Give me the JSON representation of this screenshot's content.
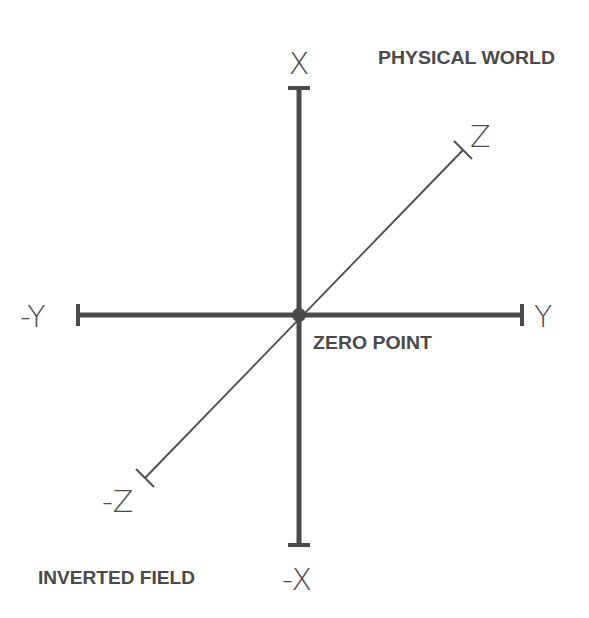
{
  "diagram": {
    "type": "coordinate-axes",
    "colors": {
      "stroke": "#4a4a4a",
      "background": "#ffffff"
    },
    "origin": {
      "label": "ZERO POINT"
    },
    "regions": {
      "top_right": "PHYSICAL WORLD",
      "bottom_left": "INVERTED FIELD"
    },
    "axes": {
      "x": {
        "positive": "X",
        "negative": "-X",
        "orientation": "vertical"
      },
      "y": {
        "positive": "Y",
        "negative": "-Y",
        "orientation": "horizontal"
      },
      "z": {
        "positive": "Z",
        "negative": "-Z",
        "orientation": "diagonal"
      }
    }
  }
}
